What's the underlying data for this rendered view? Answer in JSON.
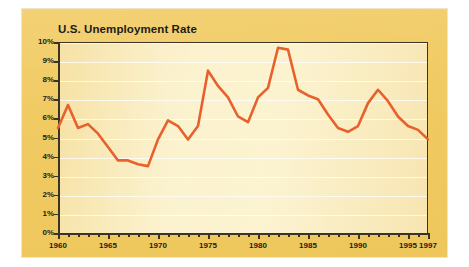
{
  "chart_data": {
    "type": "line",
    "title": "U.S. Unemployment Rate",
    "xlabel": "",
    "ylabel": "",
    "ylim": [
      0,
      10
    ],
    "xlim": [
      1960,
      1997
    ],
    "grid": true,
    "legend": false,
    "yticks": [
      0,
      1,
      2,
      3,
      4,
      5,
      6,
      7,
      8,
      9,
      10
    ],
    "ytick_labels": [
      "0%",
      "1%",
      "2%",
      "3%",
      "4%",
      "5%",
      "6%",
      "7%",
      "8%",
      "9%",
      "10%"
    ],
    "xticks": [
      1960,
      1965,
      1970,
      1975,
      1980,
      1985,
      1990,
      1995,
      1997
    ],
    "xtick_labels": [
      "1960",
      "1965",
      "1970",
      "1975",
      "1980",
      "1985",
      "1990",
      "1995",
      "1997"
    ],
    "xtick_minor_step": 1,
    "series": [
      {
        "name": "U.S. Unemployment Rate",
        "color": "#E8612C",
        "x": [
          1960,
          1961,
          1962,
          1963,
          1964,
          1965,
          1966,
          1967,
          1968,
          1969,
          1970,
          1971,
          1972,
          1973,
          1974,
          1975,
          1976,
          1977,
          1978,
          1979,
          1980,
          1981,
          1982,
          1983,
          1984,
          1985,
          1986,
          1987,
          1988,
          1989,
          1990,
          1991,
          1992,
          1993,
          1994,
          1995,
          1996,
          1997
        ],
        "values": [
          5.5,
          6.7,
          5.5,
          5.7,
          5.2,
          4.5,
          3.8,
          3.8,
          3.6,
          3.5,
          4.9,
          5.9,
          5.6,
          4.9,
          5.6,
          8.5,
          7.7,
          7.1,
          6.1,
          5.8,
          7.1,
          7.6,
          9.7,
          9.6,
          7.5,
          7.2,
          7.0,
          6.2,
          5.5,
          5.3,
          5.6,
          6.8,
          7.5,
          6.9,
          6.1,
          5.6,
          5.4,
          4.9
        ]
      }
    ]
  },
  "colors": {
    "outer_background": "#F0CA62",
    "plot_background": "#FAEEC0",
    "line": "#E8612C",
    "axis": "#3A3326",
    "gridline": "#FFFFFF",
    "text": "#1C1C1C"
  }
}
